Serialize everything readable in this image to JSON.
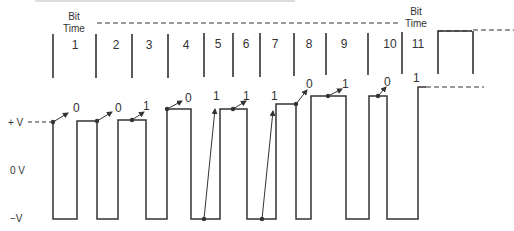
{
  "diagram": {
    "header_label_left": {
      "line1": "Bit",
      "line2": "Time"
    },
    "header_label_right": {
      "line1": "Bit",
      "line2": "Time"
    },
    "bit_numbers": [
      "1",
      "2",
      "3",
      "4",
      "5",
      "6",
      "7",
      "8",
      "9",
      "10",
      "11"
    ],
    "voltage_labels": {
      "plus": "+ V",
      "zero": "0 V",
      "minus": "−V"
    },
    "transition_values": [
      "0",
      "0",
      "1",
      "0",
      "1",
      "1",
      "1",
      "0",
      "1",
      "0",
      "1"
    ],
    "colors": {
      "line": "#333333",
      "background": "#ffffff"
    }
  }
}
